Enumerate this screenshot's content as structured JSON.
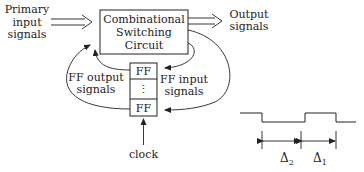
{
  "diagram": {
    "primary_input": [
      "Primary",
      "input",
      "signals"
    ],
    "circuit": [
      "Combinational",
      "Switching",
      "Circuit"
    ],
    "output": [
      "Output",
      "signals"
    ],
    "ff_cells": [
      "FF",
      "⋮",
      "FF"
    ],
    "ff_output": [
      "FF output",
      "signals"
    ],
    "ff_input": [
      "FF input",
      "signals"
    ],
    "clock": "clock"
  },
  "waveform": {
    "delta_2": "Δ",
    "delta_2_sub": "2",
    "delta_1": "Δ",
    "delta_1_sub": "1"
  },
  "colors": {
    "ink": "#222222",
    "background": "#ffffff"
  }
}
